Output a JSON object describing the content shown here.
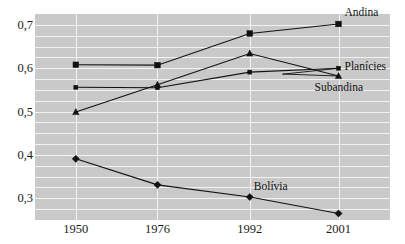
{
  "figure": {
    "cropped_caption_fragment": "",
    "background_color": "#c9c9c9",
    "line_color": "#111111",
    "grid_color": "#f2f2f2"
  },
  "chart_data": {
    "type": "line",
    "title": "",
    "subtitle": "",
    "xlabel": "",
    "ylabel": "",
    "categories": [
      "1950",
      "1976",
      "1992",
      "2001"
    ],
    "x": [
      1950,
      1976,
      1992,
      2001
    ],
    "ytick_labels": [
      "0,3",
      "0,4",
      "0,5",
      "0,6",
      "0,7"
    ],
    "ytick_values": [
      0.3,
      0.4,
      0.5,
      0.6,
      0.7
    ],
    "ylim": [
      0.25,
      0.725
    ],
    "xlim": [
      1950,
      2001
    ],
    "grid": true,
    "grid_orientation": "both",
    "legend_position": "inline-right",
    "decimal_separator": ",",
    "series": [
      {
        "name": "Andina",
        "marker": "square",
        "values": [
          0.608,
          0.607,
          0.68,
          0.702
        ]
      },
      {
        "name": "Planícies",
        "marker": "small-square",
        "values": [
          0.556,
          0.555,
          0.591,
          0.6
        ]
      },
      {
        "name": "Subandina",
        "marker": "triangle",
        "values": [
          0.499,
          0.562,
          0.634,
          0.582
        ]
      },
      {
        "name": "Bolívia",
        "marker": "diamond",
        "values": [
          0.391,
          0.331,
          0.303,
          0.265
        ]
      }
    ],
    "annotations": [
      {
        "text": "Andina",
        "series": "Andina",
        "at_x": "2001",
        "placement": "right-above"
      },
      {
        "text": "Planícies",
        "series": "Planícies",
        "at_x": "2001",
        "placement": "right"
      },
      {
        "text": "Subandina",
        "series": "Subandina",
        "at_x": "2001",
        "placement": "right-below"
      },
      {
        "text": "Bolívia",
        "series": "Bolívia",
        "at_x": "1992",
        "placement": "above"
      }
    ]
  }
}
